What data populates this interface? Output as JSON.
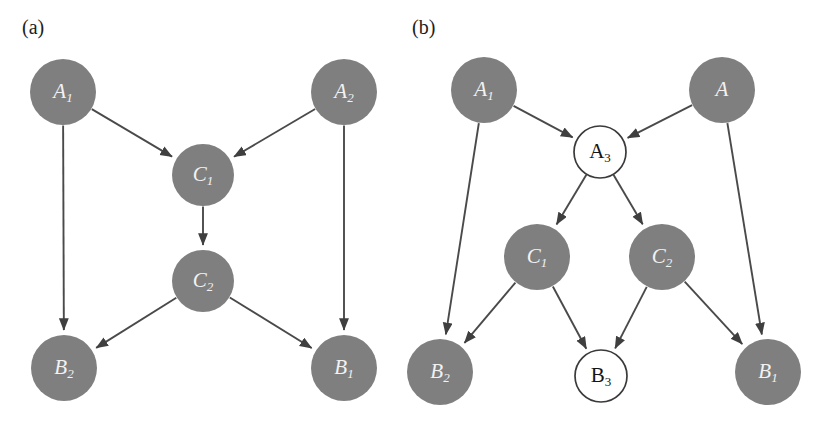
{
  "figure": {
    "width": 832,
    "height": 422,
    "background_color": "#ffffff",
    "node_fill_color": "#7f7f7f",
    "node_hollow_fill_color": "#ffffff",
    "node_stroke_color": "#3a3a3a",
    "edge_color": "#4a4a4a",
    "label_light_color": "#f2f2f2",
    "label_dark_color": "#151515"
  },
  "panels": [
    {
      "id": "a",
      "label": "(a)",
      "label_x": 22,
      "label_y": 34,
      "nodes": [
        {
          "id": "a_A1",
          "base": "A",
          "sub": "1",
          "style": "filled",
          "text_style": "italic",
          "cx": 63,
          "cy": 92,
          "r": 33
        },
        {
          "id": "a_A2",
          "base": "A",
          "sub": "2",
          "style": "filled",
          "text_style": "italic",
          "cx": 344,
          "cy": 92,
          "r": 33
        },
        {
          "id": "a_C1",
          "base": "C",
          "sub": "1",
          "style": "filled",
          "text_style": "italic",
          "cx": 203,
          "cy": 175,
          "r": 31
        },
        {
          "id": "a_C2",
          "base": "C",
          "sub": "2",
          "style": "filled",
          "text_style": "italic",
          "cx": 203,
          "cy": 281,
          "r": 31
        },
        {
          "id": "a_B2",
          "base": "B",
          "sub": "2",
          "style": "filled",
          "text_style": "italic",
          "cx": 64,
          "cy": 368,
          "r": 33
        },
        {
          "id": "a_B1",
          "base": "B",
          "sub": "1",
          "style": "filled",
          "text_style": "italic",
          "cx": 344,
          "cy": 368,
          "r": 33
        }
      ],
      "edges": [
        {
          "from": "a_A1",
          "to": "a_C1"
        },
        {
          "from": "a_A2",
          "to": "a_C1"
        },
        {
          "from": "a_C1",
          "to": "a_C2"
        },
        {
          "from": "a_A1",
          "to": "a_B2"
        },
        {
          "from": "a_A2",
          "to": "a_B1"
        },
        {
          "from": "a_C2",
          "to": "a_B2"
        },
        {
          "from": "a_C2",
          "to": "a_B1"
        }
      ]
    },
    {
      "id": "b",
      "label": "(b)",
      "label_x": 412,
      "label_y": 34,
      "nodes": [
        {
          "id": "b_A1",
          "base": "A",
          "sub": "1",
          "style": "filled",
          "text_style": "italic",
          "cx": 484,
          "cy": 90,
          "r": 33
        },
        {
          "id": "b_A",
          "base": "A",
          "sub": "",
          "style": "filled",
          "text_style": "italic",
          "cx": 722,
          "cy": 90,
          "r": 33
        },
        {
          "id": "b_A3",
          "base": "A",
          "sub": "3",
          "style": "hollow",
          "text_style": "upright",
          "cx": 600,
          "cy": 152,
          "r": 26
        },
        {
          "id": "b_C1",
          "base": "C",
          "sub": "1",
          "style": "filled",
          "text_style": "italic",
          "cx": 537,
          "cy": 257,
          "r": 33
        },
        {
          "id": "b_C2",
          "base": "C",
          "sub": "2",
          "style": "filled",
          "text_style": "italic",
          "cx": 662,
          "cy": 257,
          "r": 33
        },
        {
          "id": "b_B2",
          "base": "B",
          "sub": "2",
          "style": "filled",
          "text_style": "italic",
          "cx": 440,
          "cy": 372,
          "r": 33
        },
        {
          "id": "b_B3",
          "base": "B",
          "sub": "3",
          "style": "hollow",
          "text_style": "upright",
          "cx": 601,
          "cy": 376,
          "r": 26
        },
        {
          "id": "b_B1",
          "base": "B",
          "sub": "1",
          "style": "filled",
          "text_style": "italic",
          "cx": 768,
          "cy": 372,
          "r": 33
        }
      ],
      "edges": [
        {
          "from": "b_A1",
          "to": "b_A3"
        },
        {
          "from": "b_A",
          "to": "b_A3"
        },
        {
          "from": "b_A3",
          "to": "b_C1"
        },
        {
          "from": "b_A3",
          "to": "b_C2"
        },
        {
          "from": "b_A1",
          "to": "b_B2"
        },
        {
          "from": "b_A",
          "to": "b_B1"
        },
        {
          "from": "b_C1",
          "to": "b_B2"
        },
        {
          "from": "b_C1",
          "to": "b_B3"
        },
        {
          "from": "b_C2",
          "to": "b_B3"
        },
        {
          "from": "b_C2",
          "to": "b_B1"
        }
      ]
    }
  ]
}
